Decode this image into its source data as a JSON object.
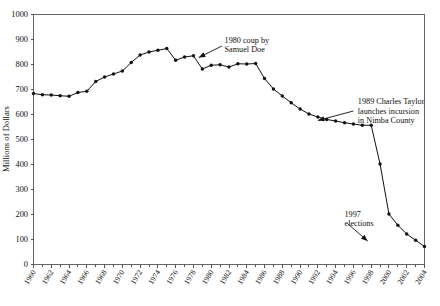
{
  "chart_data": {
    "type": "line",
    "title": "",
    "subtitle": "",
    "xlabel": "",
    "ylabel": "Millions of Dollars",
    "xlim": [
      1960,
      2004
    ],
    "ylim": [
      0,
      1000
    ],
    "grid": false,
    "legend": null,
    "legend_position": "none",
    "y_ticks": [
      0,
      100,
      200,
      300,
      400,
      500,
      600,
      700,
      800,
      900,
      1000
    ],
    "y_tick_labels": [
      "0",
      "100",
      "200",
      "300",
      "400",
      "500",
      "600",
      "700",
      "800",
      "900",
      "1000"
    ],
    "x_ticks": [
      1960,
      1962,
      1964,
      1966,
      1968,
      1970,
      1972,
      1974,
      1976,
      1978,
      1980,
      1982,
      1984,
      1986,
      1988,
      1990,
      1992,
      1994,
      1996,
      1998,
      2000,
      2002,
      2004
    ],
    "x_tick_labels": [
      "1960",
      "1962",
      "1964",
      "1966",
      "1968",
      "1970",
      "1972",
      "1974",
      "1976",
      "1978",
      "1980",
      "1982",
      "1984",
      "1986",
      "1988",
      "1990",
      "1992",
      "1994",
      "1996",
      "1998",
      "2000",
      "2002",
      "2004"
    ],
    "x_minor_tick_interval": 1,
    "x": [
      1960,
      1961,
      1962,
      1963,
      1964,
      1965,
      1966,
      1967,
      1968,
      1969,
      1970,
      1971,
      1972,
      1973,
      1974,
      1975,
      1976,
      1977,
      1978,
      1979,
      1980,
      1981,
      1982,
      1983,
      1984,
      1985,
      1986,
      1987,
      1988,
      1989,
      1990,
      1991,
      1992,
      1993,
      1994,
      1995,
      1996,
      1997,
      1998,
      1999,
      2000,
      2001,
      2002,
      2003,
      2004
    ],
    "values": [
      682,
      677,
      676,
      673,
      671,
      686,
      691,
      730,
      748,
      760,
      772,
      806,
      836,
      848,
      855,
      862,
      815,
      828,
      833,
      780,
      795,
      797,
      788,
      801,
      800,
      802,
      742,
      700,
      672,
      645,
      620,
      600,
      588,
      578,
      572,
      565,
      560,
      555,
      555,
      400,
      200,
      155,
      120,
      95,
      70
    ],
    "series": [
      {
        "name": "GDP",
        "marker": "filled-circle",
        "color": "#111111",
        "x": [
          1960,
          1961,
          1962,
          1963,
          1964,
          1965,
          1966,
          1967,
          1968,
          1969,
          1970,
          1971,
          1972,
          1973,
          1974,
          1975,
          1976,
          1977,
          1978,
          1979,
          1980,
          1981,
          1982,
          1983,
          1984,
          1985,
          1986,
          1987,
          1988,
          1989,
          1990,
          1991,
          1992,
          1993,
          1994,
          1995,
          1996,
          1997,
          1998,
          1999,
          2000,
          2001,
          2002,
          2003,
          2004
        ],
        "y": [
          682,
          677,
          676,
          673,
          671,
          686,
          691,
          730,
          748,
          760,
          772,
          806,
          836,
          848,
          855,
          862,
          815,
          828,
          833,
          780,
          795,
          797,
          788,
          801,
          800,
          802,
          742,
          700,
          672,
          645,
          620,
          600,
          588,
          578,
          572,
          565,
          560,
          555,
          555,
          400,
          200,
          155,
          120,
          95,
          70
        ]
      }
    ],
    "annotations": [
      {
        "id": "annot-1980-coup",
        "lines": [
          "1980 coup by",
          "Samuel Doe"
        ],
        "text": "1980 coup by Samuel Doe",
        "text_x": 1981.5,
        "text_y": 885,
        "arrow_from": [
          1981.2,
          872
        ],
        "arrow_to": [
          1978.6,
          826
        ]
      },
      {
        "id": "annot-1989-taylor",
        "lines": [
          "1989 Charles Taylor",
          "launches incursion",
          "in Nimba County"
        ],
        "text": "1989 Charles Taylor launches incursion in Nimba County",
        "text_x": 1996.5,
        "text_y": 640,
        "arrow_from": [
          1996.0,
          612
        ],
        "arrow_to": [
          1992.0,
          574
        ]
      },
      {
        "id": "annot-1997-elections",
        "lines": [
          "1997",
          "elections"
        ],
        "text": "1997 elections",
        "text_x": 1995.0,
        "text_y": 190,
        "arrow_from": [
          1995.4,
          160
        ],
        "arrow_to": [
          1997.6,
          92
        ]
      }
    ]
  }
}
